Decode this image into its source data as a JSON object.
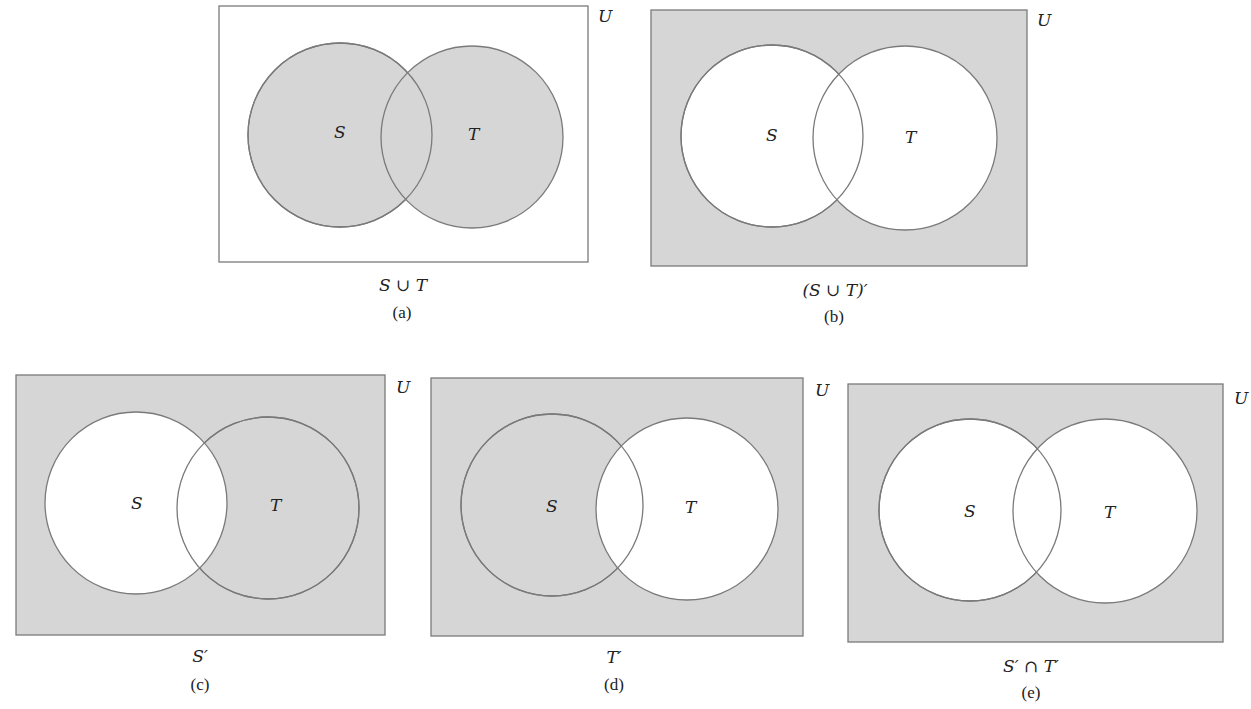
{
  "colors": {
    "shade": "#d6d6d6",
    "stroke": "#7a7a7a",
    "white": "#ffffff",
    "text": "#222222"
  },
  "diagrams": [
    {
      "id": "a",
      "expression": "S ∪ T",
      "label": "(a)",
      "universe_label": "U",
      "set_labels": [
        "S",
        "T"
      ],
      "shaded_regions": [
        "S only",
        "S ∩ T",
        "T only"
      ]
    },
    {
      "id": "b",
      "expression": "(S ∪ T)′",
      "label": "(b)",
      "universe_label": "U",
      "set_labels": [
        "S",
        "T"
      ],
      "shaded_regions": [
        "outside S and T"
      ]
    },
    {
      "id": "c",
      "expression": "S′",
      "label": "(c)",
      "universe_label": "U",
      "set_labels": [
        "S",
        "T"
      ],
      "shaded_regions": [
        "outside S and T",
        "T only"
      ]
    },
    {
      "id": "d",
      "expression": "T′",
      "label": "(d)",
      "universe_label": "U",
      "set_labels": [
        "S",
        "T"
      ],
      "shaded_regions": [
        "outside S and T",
        "S only"
      ]
    },
    {
      "id": "e",
      "expression": "S′ ∩ T′",
      "label": "(e)",
      "universe_label": "U",
      "set_labels": [
        "S",
        "T"
      ],
      "shaded_regions": [
        "outside S and T"
      ]
    }
  ]
}
